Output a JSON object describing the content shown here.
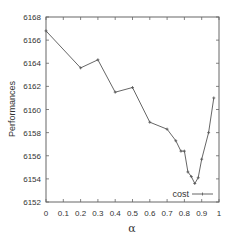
{
  "chart_data": {
    "type": "line",
    "title": "",
    "xlabel": "α",
    "ylabel": "Performances",
    "xlim": [
      0,
      1
    ],
    "ylim": [
      6152,
      6168
    ],
    "x_ticks": [
      0,
      0.1,
      0.2,
      0.3,
      0.4,
      0.5,
      0.6,
      0.7,
      0.8,
      0.9,
      1
    ],
    "x_tick_labels": [
      "0",
      "0.1",
      "0.2",
      "0.3",
      "0.4",
      "0.5",
      "0.6",
      "0.7",
      "0.8",
      "0.9",
      "1"
    ],
    "y_ticks": [
      6152,
      6154,
      6156,
      6158,
      6160,
      6162,
      6164,
      6166,
      6168
    ],
    "y_tick_labels": [
      "6152",
      "6154",
      "6156",
      "6158",
      "6160",
      "6162",
      "6164",
      "6166",
      "6168"
    ],
    "grid": false,
    "legend_position": "lower right",
    "series": [
      {
        "name": "cost",
        "color": "#555555",
        "marker": "+",
        "x": [
          0,
          0.2,
          0.3,
          0.4,
          0.5,
          0.6,
          0.7,
          0.75,
          0.78,
          0.8,
          0.82,
          0.84,
          0.86,
          0.88,
          0.9,
          0.94,
          0.97
        ],
        "y": [
          6166.8,
          6163.6,
          6164.3,
          6161.5,
          6161.9,
          6158.9,
          6158.3,
          6157.3,
          6156.4,
          6156.4,
          6154.6,
          6154.2,
          6153.6,
          6154.1,
          6155.7,
          6158.0,
          6161.0
        ]
      }
    ]
  }
}
